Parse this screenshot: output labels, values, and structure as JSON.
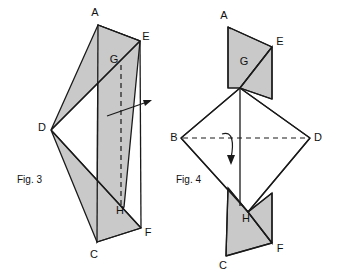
{
  "figure_set": {
    "background_color": "#ffffff",
    "shaded_fill": "#c9c9c9",
    "line_color": "#1a1a1a",
    "white_fill": "#ffffff",
    "subject": "paper folding construction diagrams"
  },
  "figures": [
    {
      "id": "fig3",
      "caption": "Fig. 3",
      "caption_x": 17,
      "caption_y": 180,
      "description": "Folded sheet shown edge-on as two overlapping shaded triangles forming a bowtie, with a vertical dashed fold line and a straight arrow indicating the unfolding direction.",
      "shaded_polygons": [
        {
          "name": "upper-shaded-panel",
          "points": "98,25 140,41 124,207 97,242"
        },
        {
          "name": "left-wing-triangle",
          "points": "140,41 51,130 98,25"
        },
        {
          "name": "lower-wing-triangle",
          "points": "51,130 141,228 97,242"
        }
      ],
      "edges": [
        {
          "name": "edge-A-E",
          "d": "M 98,25 L 140,41"
        },
        {
          "name": "edge-E-G-D",
          "d": "M 140,41 L 51,130"
        },
        {
          "name": "edge-D-H-F",
          "d": "M 51,130 L 141,228"
        },
        {
          "name": "edge-F-C",
          "d": "M 141,228 L 97,242"
        },
        {
          "name": "edge-C-A-left-side",
          "d": "M 97,242 L 98,25"
        },
        {
          "name": "edge-E-F-right-side",
          "d": "M 140,41 L 141,228"
        }
      ],
      "dashed_fold": {
        "name": "fold-line-GH",
        "d": "M 121,65 L 121,206"
      },
      "arrow": {
        "name": "unfold-direction-arrow",
        "line": "M 107,116 L 150,101",
        "head": "152,100 143,100 145,106"
      },
      "vertex_labels": [
        {
          "id": "A",
          "text": "A",
          "x": 95,
          "y": 13,
          "anchor": "middle"
        },
        {
          "id": "E",
          "text": "E",
          "x": 146,
          "y": 37,
          "anchor": "middle"
        },
        {
          "id": "G",
          "text": "G",
          "x": 114,
          "y": 60,
          "anchor": "middle"
        },
        {
          "id": "D",
          "text": "D",
          "x": 42,
          "y": 128,
          "anchor": "middle"
        },
        {
          "id": "H",
          "text": "H",
          "x": 120,
          "y": 211,
          "anchor": "middle"
        },
        {
          "id": "C",
          "text": "C",
          "x": 94,
          "y": 255,
          "anchor": "middle"
        },
        {
          "id": "F",
          "text": "F",
          "x": 148,
          "y": 233,
          "anchor": "middle"
        }
      ]
    },
    {
      "id": "fig4",
      "caption": "Fig. 4",
      "caption_x": 176,
      "caption_y": 180,
      "description": "Partially opened sheet: a white square rotated 45 degrees with corners B and D at the sides, overlaid by shaded folded flaps at the top (A, E, G) and at the bottom (C, F, H), with a horizontal dashed centre line and a curved arrow showing the fold motion.",
      "white_polygons": [
        {
          "name": "open-diamond-body",
          "points": "240,88 310,138 248,212 181,138"
        }
      ],
      "shaded_polygons": [
        {
          "name": "top-left-shaded-flap",
          "points": "228,27 272,47 240,88 228,88"
        },
        {
          "name": "top-right-shaded-flap",
          "points": "272,47 272,99 240,88"
        },
        {
          "name": "bottom-left-shaded-flap",
          "points": "228,188 248,212 272,243 226,256"
        },
        {
          "name": "bottom-right-shaded-flap",
          "points": "248,212 272,193 272,243"
        }
      ],
      "edges": [
        {
          "name": "edge-A-E-top",
          "d": "M 228,27 L 272,47"
        },
        {
          "name": "edge-A-ridge",
          "d": "M 228,27 L 231,29"
        },
        {
          "name": "edge-A-left-side",
          "d": "M 228,27 L 228,88"
        },
        {
          "name": "edge-E-G-diagonal",
          "d": "M 272,47 L 240,88"
        },
        {
          "name": "edge-E-right-side",
          "d": "M 272,47 L 272,99"
        },
        {
          "name": "edge-G-down-left",
          "d": "M 240,88 L 181,138"
        },
        {
          "name": "edge-G-down-right",
          "d": "M 240,88 L 310,138"
        },
        {
          "name": "edge-G-vertical-centre",
          "d": "M 240,88 L 240,206"
        },
        {
          "name": "edge-G-to-flapcorner",
          "d": "M 240,88 L 272,99"
        },
        {
          "name": "edge-B-down-to-H",
          "d": "M 181,138 L 248,212"
        },
        {
          "name": "edge-D-down-to-H",
          "d": "M 310,138 L 248,212"
        },
        {
          "name": "edge-H-left-up",
          "d": "M 248,212 L 228,188"
        },
        {
          "name": "edge-H-right-up",
          "d": "M 248,212 L 272,193"
        },
        {
          "name": "edge-H-F-diagonal",
          "d": "M 248,212 L 272,243"
        },
        {
          "name": "edge-left-flap-side",
          "d": "M 228,188 L 226,256"
        },
        {
          "name": "edge-C-F-bottom",
          "d": "M 226,256 L 272,243"
        },
        {
          "name": "edge-F-right-side",
          "d": "M 272,243 L 272,193"
        }
      ],
      "dashed_fold": {
        "name": "centre-line-BD",
        "d": "M 183,138 L 308,138"
      },
      "arrow": {
        "name": "fold-motion-arrow",
        "line": "M 222,134 C 233,130 234,144 231,158",
        "head": "231,165 227,155 235,155"
      },
      "vertex_labels": [
        {
          "id": "A",
          "text": "A",
          "x": 224,
          "y": 16,
          "anchor": "middle"
        },
        {
          "id": "E",
          "text": "E",
          "x": 280,
          "y": 42,
          "anchor": "middle"
        },
        {
          "id": "G",
          "text": "G",
          "x": 244,
          "y": 62,
          "anchor": "middle"
        },
        {
          "id": "B",
          "text": "B",
          "x": 174,
          "y": 138,
          "anchor": "middle"
        },
        {
          "id": "D",
          "text": "D",
          "x": 318,
          "y": 138,
          "anchor": "middle"
        },
        {
          "id": "H",
          "text": "H",
          "x": 246,
          "y": 219,
          "anchor": "middle"
        },
        {
          "id": "C",
          "text": "C",
          "x": 223,
          "y": 266,
          "anchor": "middle"
        },
        {
          "id": "F",
          "text": "F",
          "x": 280,
          "y": 249,
          "anchor": "middle"
        }
      ]
    }
  ]
}
